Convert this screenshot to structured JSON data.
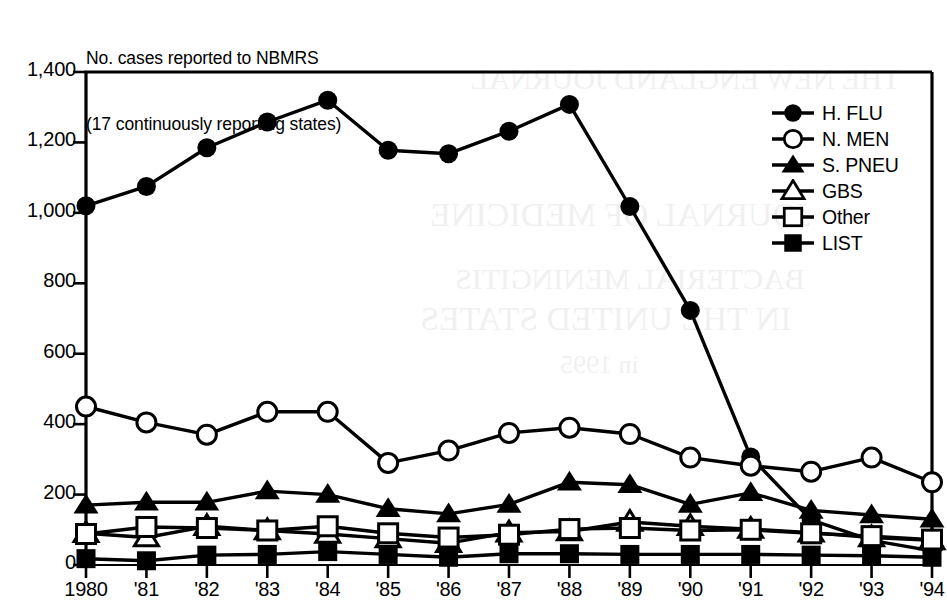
{
  "caption": {
    "line1": "No. cases reported to NBMRS",
    "line2": "(17 continuously reporting states)"
  },
  "legend": {
    "position": "top-right",
    "items": [
      {
        "label": "H. FLU",
        "marker": "filled-circle",
        "icon": "filled-circle-marker-icon"
      },
      {
        "label": "N. MEN",
        "marker": "open-circle",
        "icon": "open-circle-marker-icon"
      },
      {
        "label": "S. PNEU",
        "marker": "filled-triangle",
        "icon": "filled-triangle-marker-icon"
      },
      {
        "label": "GBS",
        "marker": "open-triangle",
        "icon": "open-triangle-marker-icon"
      },
      {
        "label": "Other",
        "marker": "open-square",
        "icon": "open-square-marker-icon"
      },
      {
        "label": "LIST",
        "marker": "filled-square",
        "icon": "filled-square-marker-icon"
      }
    ]
  },
  "axes": {
    "y_ticks": [
      "0",
      "200",
      "400",
      "600",
      "800",
      "1,000",
      "1,200",
      "1,400"
    ],
    "x_ticks": [
      "1980",
      "'81",
      "'82",
      "'83",
      "'84",
      "'85",
      "'86",
      "'87",
      "'88",
      "'89",
      "'90",
      "'91",
      "'92",
      "'93",
      "'94"
    ]
  },
  "ghost_text": [
    {
      "text": "THE NEW ENGLAND JOURNAL",
      "x": 470,
      "y": 62,
      "size": 30
    },
    {
      "text": "JOURNAL OF MEDICINE",
      "x": 430,
      "y": 196,
      "size": 34
    },
    {
      "text": "BACTERIAL MENINGITIS",
      "x": 455,
      "y": 262,
      "size": 30
    },
    {
      "text": "IN THE UNITED STATES",
      "x": 420,
      "y": 300,
      "size": 34
    },
    {
      "text": "in 1995",
      "x": 560,
      "y": 350,
      "size": 26
    }
  ],
  "chart_data": {
    "type": "line",
    "title": "No. cases reported to NBMRS (17 continuously reporting states)",
    "xlabel": "",
    "ylabel": "No. cases reported to NBMRS",
    "ylim": [
      0,
      1400
    ],
    "ytick_values": [
      0,
      200,
      400,
      600,
      800,
      1000,
      1200,
      1400
    ],
    "grid": false,
    "legend_position": "top-right",
    "categories": [
      "1980",
      "'81",
      "'82",
      "'83",
      "'84",
      "'85",
      "'86",
      "'87",
      "'88",
      "'89",
      "'90",
      "'91",
      "'92",
      "'93",
      "'94"
    ],
    "x": [
      1980,
      1981,
      1982,
      1983,
      1984,
      1985,
      1986,
      1987,
      1988,
      1989,
      1990,
      1991,
      1992,
      1993,
      1994
    ],
    "series": [
      {
        "name": "H. FLU",
        "marker": "filled-circle",
        "values": [
          1020,
          1075,
          1185,
          1258,
          1320,
          1178,
          1168,
          1232,
          1308,
          1018,
          723,
          307,
          128,
          70,
          40
        ]
      },
      {
        "name": "N. MEN",
        "marker": "open-circle",
        "values": [
          450,
          405,
          370,
          435,
          435,
          290,
          325,
          375,
          390,
          372,
          305,
          282,
          265,
          305,
          235
        ]
      },
      {
        "name": "S. PNEU",
        "marker": "filled-triangle",
        "values": [
          170,
          178,
          178,
          210,
          200,
          160,
          145,
          172,
          235,
          228,
          172,
          205,
          155,
          142,
          130
        ]
      },
      {
        "name": "GBS",
        "marker": "open-triangle",
        "values": [
          90,
          78,
          110,
          98,
          88,
          75,
          62,
          92,
          95,
          122,
          110,
          102,
          92,
          78,
          70
        ]
      },
      {
        "name": "Other",
        "marker": "open-square",
        "values": [
          88,
          108,
          105,
          98,
          110,
          90,
          78,
          86,
          102,
          105,
          98,
          100,
          90,
          82,
          72
        ]
      },
      {
        "name": "LIST",
        "marker": "filled-square",
        "values": [
          18,
          12,
          28,
          30,
          38,
          30,
          22,
          32,
          32,
          30,
          30,
          30,
          28,
          26,
          22
        ]
      }
    ]
  }
}
